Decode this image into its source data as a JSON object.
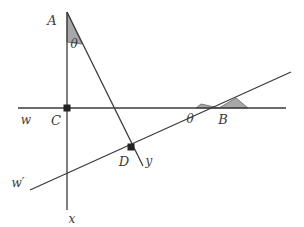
{
  "figure": {
    "width": 304,
    "height": 227,
    "background_color": "#ffffff",
    "line_color": "#3b3b3b",
    "wedge_fill_color": "#a8a8a8",
    "wedge_stroke_color": "#6e6e6e",
    "point_color": "#222222"
  },
  "labels": {
    "point_a": "A",
    "point_b": "B",
    "point_c": "C",
    "point_d": "D",
    "axis_w": "w",
    "axis_w_prime": "w′",
    "axis_x": "x",
    "axis_y": "y",
    "angle_theta_top": "θ",
    "angle_theta_right": "θ"
  },
  "geometry": {
    "vertical_line_x": {
      "name": "line-x-vertical",
      "x1": 67,
      "y1": 12,
      "x2": 67,
      "y2": 210
    },
    "horizontal_line_w": {
      "name": "line-w-horizontal",
      "x1": 18,
      "y1": 108,
      "x2": 286,
      "y2": 108
    },
    "rising_line_w_prime": {
      "name": "line-w-prime-rising",
      "x1": 30,
      "y1": 190,
      "x2": 291,
      "y2": 72
    },
    "descending_line_y": {
      "name": "line-y-descending",
      "x1": 67,
      "y1": 12,
      "x2": 143,
      "y2": 166
    },
    "points": [
      {
        "name": "point-c",
        "label": "C",
        "x": 67,
        "y": 108
      },
      {
        "name": "point-d",
        "label": "D",
        "x": 131,
        "y": 147
      },
      {
        "name": "point-b",
        "label": "B",
        "x": 219,
        "y": 108
      }
    ],
    "angle_wedges": [
      {
        "name": "wedge-theta-at-a",
        "vertex_x": 67,
        "vertex_y": 12,
        "points": "67,12 67,42 82,44"
      },
      {
        "name": "wedge-theta-left-of-b",
        "vertex_x": 219,
        "vertex_y": 108,
        "points": "219,108 196,108 201,105"
      },
      {
        "name": "wedge-at-b-right",
        "vertex_x": 219,
        "vertex_y": 108,
        "points": "219,108 247,108 236,99"
      }
    ],
    "label_positions": {
      "point_a": {
        "x": 52,
        "y": 25
      },
      "point_b": {
        "x": 221,
        "y": 123
      },
      "point_c": {
        "x": 55,
        "y": 124
      },
      "point_d": {
        "x": 122,
        "y": 165
      },
      "axis_w": {
        "x": 24,
        "y": 123
      },
      "axis_w_prime": {
        "x": 13,
        "y": 186
      },
      "axis_x": {
        "x": 70,
        "y": 224
      },
      "axis_y": {
        "x": 147,
        "y": 164
      },
      "angle_theta_top": {
        "x": 72,
        "y": 45
      },
      "angle_theta_right": {
        "x": 189,
        "y": 122
      }
    }
  }
}
